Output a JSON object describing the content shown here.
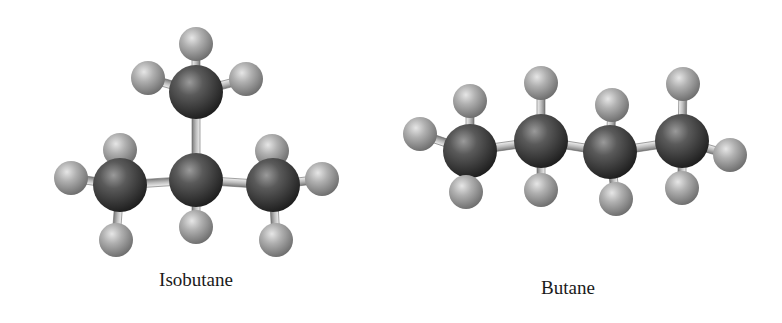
{
  "figure": {
    "molecules": [
      {
        "id": "isobutane",
        "label": "Isobutane",
        "formula_atoms": {
          "carbon": 4,
          "hydrogen": 10
        }
      },
      {
        "id": "butane",
        "label": "Butane",
        "formula_atoms": {
          "carbon": 4,
          "hydrogen": 10
        }
      }
    ],
    "colors": {
      "carbon": "#4a4a4a",
      "hydrogen": "#a8a8a8",
      "bond": "#c8c8c8",
      "background": "#ffffff"
    },
    "model_style": "ball-and-stick"
  }
}
